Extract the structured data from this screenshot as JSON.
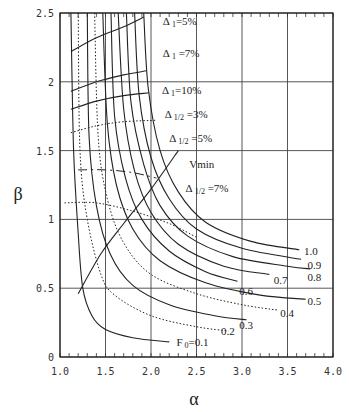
{
  "chart_data": {
    "type": "line",
    "title": "",
    "xlabel": "α",
    "ylabel": "β",
    "xlim": [
      1.0,
      4.0
    ],
    "ylim": [
      0,
      2.5
    ],
    "grid": true,
    "x_ticks": [
      "1.0",
      "1.5",
      "2.0",
      "2.5",
      "3.0",
      "3.5",
      "4.0"
    ],
    "y_ticks": [
      "0",
      "0.5",
      "1",
      "1.5",
      "2",
      "2.5"
    ],
    "series_F0": [
      {
        "name": "F0=0.1",
        "style": "solid",
        "points": [
          [
            1.12,
            2.5
          ],
          [
            1.15,
            1.5
          ],
          [
            1.2,
            0.9
          ],
          [
            1.25,
            0.5
          ],
          [
            1.35,
            0.3
          ],
          [
            1.5,
            0.2
          ],
          [
            1.8,
            0.14
          ],
          [
            2.2,
            0.11
          ]
        ]
      },
      {
        "name": "0.2",
        "style": "dotted",
        "points": [
          [
            1.2,
            2.5
          ],
          [
            1.22,
            1.5
          ],
          [
            1.3,
            1.0
          ],
          [
            1.45,
            0.6
          ],
          [
            1.6,
            0.45
          ],
          [
            2.0,
            0.3
          ],
          [
            2.5,
            0.22
          ],
          [
            2.85,
            0.19
          ]
        ]
      },
      {
        "name": "0.3",
        "style": "solid",
        "points": [
          [
            1.3,
            2.5
          ],
          [
            1.32,
            1.6
          ],
          [
            1.4,
            1.1
          ],
          [
            1.55,
            0.75
          ],
          [
            1.8,
            0.52
          ],
          [
            2.2,
            0.38
          ],
          [
            2.7,
            0.3
          ],
          [
            3.05,
            0.27
          ]
        ]
      },
      {
        "name": "0.4",
        "style": "dotted",
        "points": [
          [
            1.38,
            2.5
          ],
          [
            1.42,
            1.6
          ],
          [
            1.52,
            1.15
          ],
          [
            1.7,
            0.83
          ],
          [
            2.0,
            0.6
          ],
          [
            2.5,
            0.46
          ],
          [
            3.0,
            0.38
          ],
          [
            3.4,
            0.34
          ]
        ]
      },
      {
        "name": "0.5",
        "style": "solid",
        "points": [
          [
            1.47,
            2.5
          ],
          [
            1.52,
            1.7
          ],
          [
            1.62,
            1.25
          ],
          [
            1.8,
            0.93
          ],
          [
            2.1,
            0.7
          ],
          [
            2.6,
            0.54
          ],
          [
            3.2,
            0.45
          ],
          [
            3.7,
            0.42
          ]
        ]
      },
      {
        "name": "0.6",
        "style": "solid",
        "points": [
          [
            1.56,
            2.5
          ],
          [
            1.6,
            1.75
          ],
          [
            1.72,
            1.3
          ],
          [
            1.9,
            1.0
          ],
          [
            2.2,
            0.77
          ],
          [
            2.6,
            0.62
          ],
          [
            2.95,
            0.55
          ]
        ]
      },
      {
        "name": "0.7",
        "style": "solid",
        "points": [
          [
            1.64,
            2.5
          ],
          [
            1.7,
            1.8
          ],
          [
            1.82,
            1.35
          ],
          [
            2.0,
            1.05
          ],
          [
            2.3,
            0.82
          ],
          [
            2.8,
            0.66
          ],
          [
            3.3,
            0.6
          ]
        ]
      },
      {
        "name": "0.8",
        "style": "solid",
        "points": [
          [
            1.73,
            2.5
          ],
          [
            1.78,
            1.85
          ],
          [
            1.92,
            1.4
          ],
          [
            2.1,
            1.1
          ],
          [
            2.4,
            0.88
          ],
          [
            2.9,
            0.73
          ],
          [
            3.5,
            0.66
          ],
          [
            3.75,
            0.64
          ]
        ]
      },
      {
        "name": "0.9",
        "style": "solid",
        "points": [
          [
            1.82,
            2.5
          ],
          [
            1.87,
            1.9
          ],
          [
            2.0,
            1.45
          ],
          [
            2.2,
            1.15
          ],
          [
            2.5,
            0.93
          ],
          [
            3.0,
            0.79
          ],
          [
            3.65,
            0.71
          ]
        ]
      },
      {
        "name": "1.0",
        "style": "solid",
        "points": [
          [
            1.92,
            2.5
          ],
          [
            1.97,
            1.95
          ],
          [
            2.1,
            1.5
          ],
          [
            2.3,
            1.2
          ],
          [
            2.6,
            0.98
          ],
          [
            3.1,
            0.84
          ],
          [
            3.63,
            0.78
          ]
        ]
      }
    ],
    "series_delta": [
      {
        "name": "Δ1=5%",
        "style": "solid",
        "points": [
          [
            1.12,
            2.22
          ],
          [
            1.4,
            2.32
          ],
          [
            1.7,
            2.4
          ],
          [
            1.92,
            2.47
          ]
        ]
      },
      {
        "name": "Δ1=7%",
        "style": "solid",
        "points": [
          [
            1.12,
            1.93
          ],
          [
            1.4,
            2.0
          ],
          [
            1.7,
            2.05
          ],
          [
            1.95,
            2.08
          ]
        ]
      },
      {
        "name": "Δ1=10%",
        "style": "solid",
        "points": [
          [
            1.12,
            1.8
          ],
          [
            1.4,
            1.86
          ],
          [
            1.7,
            1.9
          ],
          [
            1.98,
            1.92
          ]
        ]
      },
      {
        "name": "Δ1/2=3%",
        "style": "dotted",
        "points": [
          [
            1.12,
            1.63
          ],
          [
            1.4,
            1.68
          ],
          [
            1.7,
            1.71
          ],
          [
            2.05,
            1.72
          ]
        ]
      },
      {
        "name": "Δ1/2=5%",
        "style": "dashed",
        "points": [
          [
            1.2,
            1.36
          ],
          [
            1.5,
            1.36
          ],
          [
            1.8,
            1.34
          ],
          [
            2.06,
            1.3
          ]
        ]
      },
      {
        "name": "Δ1/2=7%",
        "style": "dotted",
        "points": [
          [
            1.05,
            1.12
          ],
          [
            1.4,
            1.12
          ],
          [
            1.8,
            1.06
          ],
          [
            2.2,
            0.97
          ],
          [
            2.5,
            0.87
          ]
        ]
      },
      {
        "name": "Vmin",
        "style": "solid",
        "points": [
          [
            1.2,
            0.46
          ],
          [
            1.45,
            0.75
          ],
          [
            1.7,
            0.97
          ],
          [
            2.0,
            1.22
          ],
          [
            2.3,
            1.5
          ]
        ]
      }
    ],
    "annotations": [
      {
        "text": "Δ",
        "sub": "1",
        "rest": "=5%",
        "alpha": 2.13,
        "beta": 2.41
      },
      {
        "text": "Δ",
        "sub": "1",
        "rest": " =7%",
        "alpha": 2.13,
        "beta": 2.18
      },
      {
        "text": "Δ",
        "sub": "1",
        "rest": "=10%",
        "alpha": 2.12,
        "beta": 1.91
      },
      {
        "text": "Δ",
        "sub": "1/2",
        "rest": " =3%",
        "alpha": 2.15,
        "beta": 1.74
      },
      {
        "text": "Δ",
        "sub": "1/2",
        "rest": " =5%",
        "alpha": 2.2,
        "beta": 1.56
      },
      {
        "text": "Vmin",
        "sub": "",
        "rest": "",
        "alpha": 2.42,
        "beta": 1.37
      },
      {
        "text": "Δ",
        "sub": "1/2",
        "rest": " =7%",
        "alpha": 2.38,
        "beta": 1.2
      },
      {
        "text": "1.0",
        "sub": "",
        "rest": "",
        "alpha": 3.68,
        "beta": 0.74
      },
      {
        "text": "0.9",
        "sub": "",
        "rest": "",
        "alpha": 3.72,
        "beta": 0.64
      },
      {
        "text": "0.8",
        "sub": "",
        "rest": "",
        "alpha": 3.72,
        "beta": 0.55
      },
      {
        "text": "0.7",
        "sub": "",
        "rest": "",
        "alpha": 3.35,
        "beta": 0.53
      },
      {
        "text": "0.6",
        "sub": "",
        "rest": "",
        "alpha": 2.97,
        "beta": 0.45
      },
      {
        "text": "0.5",
        "sub": "",
        "rest": "",
        "alpha": 3.72,
        "beta": 0.38
      },
      {
        "text": "0.4",
        "sub": "",
        "rest": "",
        "alpha": 3.42,
        "beta": 0.29
      },
      {
        "text": "0.3",
        "sub": "",
        "rest": "",
        "alpha": 2.97,
        "beta": 0.2
      },
      {
        "text": "0.2",
        "sub": "",
        "rest": "",
        "alpha": 2.77,
        "beta": 0.16
      },
      {
        "text": "F",
        "sub": "0",
        "rest": "=0.1",
        "alpha": 2.28,
        "beta": 0.08
      }
    ]
  }
}
